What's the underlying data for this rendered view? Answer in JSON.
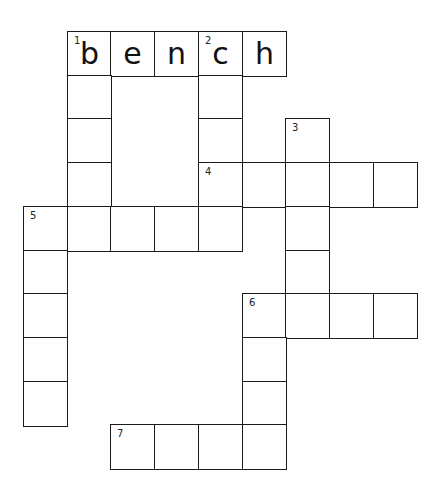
{
  "puzzle": {
    "type": "crossword",
    "cell_size": 43.7,
    "origin": {
      "x": 23,
      "y": 31
    },
    "cells": [
      {
        "row": 0,
        "col": 1,
        "number": "1",
        "letter": "b"
      },
      {
        "row": 0,
        "col": 2,
        "number": "",
        "letter": "e"
      },
      {
        "row": 0,
        "col": 3,
        "number": "",
        "letter": "n"
      },
      {
        "row": 0,
        "col": 4,
        "number": "2",
        "letter": "c"
      },
      {
        "row": 0,
        "col": 5,
        "number": "",
        "letter": "h"
      },
      {
        "row": 1,
        "col": 1,
        "number": "",
        "letter": ""
      },
      {
        "row": 1,
        "col": 4,
        "number": "",
        "letter": ""
      },
      {
        "row": 2,
        "col": 1,
        "number": "",
        "letter": ""
      },
      {
        "row": 2,
        "col": 4,
        "number": "",
        "letter": ""
      },
      {
        "row": 2,
        "col": 6,
        "number": "3",
        "letter": ""
      },
      {
        "row": 3,
        "col": 1,
        "number": "",
        "letter": ""
      },
      {
        "row": 3,
        "col": 4,
        "number": "4",
        "letter": ""
      },
      {
        "row": 3,
        "col": 5,
        "number": "",
        "letter": ""
      },
      {
        "row": 3,
        "col": 6,
        "number": "",
        "letter": ""
      },
      {
        "row": 3,
        "col": 7,
        "number": "",
        "letter": ""
      },
      {
        "row": 3,
        "col": 8,
        "number": "",
        "letter": ""
      },
      {
        "row": 4,
        "col": 0,
        "number": "5",
        "letter": ""
      },
      {
        "row": 4,
        "col": 1,
        "number": "",
        "letter": ""
      },
      {
        "row": 4,
        "col": 2,
        "number": "",
        "letter": ""
      },
      {
        "row": 4,
        "col": 3,
        "number": "",
        "letter": ""
      },
      {
        "row": 4,
        "col": 4,
        "number": "",
        "letter": ""
      },
      {
        "row": 4,
        "col": 6,
        "number": "",
        "letter": ""
      },
      {
        "row": 5,
        "col": 0,
        "number": "",
        "letter": ""
      },
      {
        "row": 5,
        "col": 6,
        "number": "",
        "letter": ""
      },
      {
        "row": 6,
        "col": 0,
        "number": "",
        "letter": ""
      },
      {
        "row": 6,
        "col": 5,
        "number": "6",
        "letter": ""
      },
      {
        "row": 6,
        "col": 6,
        "number": "",
        "letter": ""
      },
      {
        "row": 6,
        "col": 7,
        "number": "",
        "letter": ""
      },
      {
        "row": 6,
        "col": 8,
        "number": "",
        "letter": ""
      },
      {
        "row": 7,
        "col": 0,
        "number": "",
        "letter": ""
      },
      {
        "row": 7,
        "col": 5,
        "number": "",
        "letter": ""
      },
      {
        "row": 8,
        "col": 0,
        "number": "",
        "letter": ""
      },
      {
        "row": 8,
        "col": 5,
        "number": "",
        "letter": ""
      },
      {
        "row": 9,
        "col": 2,
        "number": "7",
        "letter": ""
      },
      {
        "row": 9,
        "col": 3,
        "number": "",
        "letter": ""
      },
      {
        "row": 9,
        "col": 4,
        "number": "",
        "letter": ""
      },
      {
        "row": 9,
        "col": 5,
        "number": "",
        "letter": ""
      }
    ],
    "entries": [
      {
        "number": "1",
        "direction": "across",
        "length": 5,
        "answer": "bench"
      },
      {
        "number": "1",
        "direction": "down",
        "length": 5,
        "answer": ""
      },
      {
        "number": "2",
        "direction": "down",
        "length": 5,
        "answer": ""
      },
      {
        "number": "3",
        "direction": "down",
        "length": 5,
        "answer": ""
      },
      {
        "number": "4",
        "direction": "across",
        "length": 5,
        "answer": ""
      },
      {
        "number": "5",
        "direction": "across",
        "length": 5,
        "answer": ""
      },
      {
        "number": "5",
        "direction": "down",
        "length": 5,
        "answer": ""
      },
      {
        "number": "6",
        "direction": "across",
        "length": 4,
        "answer": ""
      },
      {
        "number": "6",
        "direction": "down",
        "length": 4,
        "answer": ""
      },
      {
        "number": "7",
        "direction": "across",
        "length": 4,
        "answer": ""
      }
    ]
  }
}
